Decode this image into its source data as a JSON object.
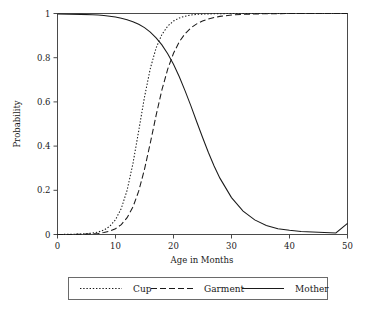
{
  "chart_data": {
    "type": "line",
    "title": "",
    "xlabel": "Age in Months",
    "ylabel": "Probability",
    "xlim": [
      0,
      50
    ],
    "ylim": [
      0,
      1
    ],
    "grid": false,
    "legend_position": "bottom",
    "xticks": [
      "0",
      "10",
      "20",
      "30",
      "40",
      "50"
    ],
    "xtick_values": [
      0,
      10,
      20,
      30,
      40,
      50
    ],
    "yticks": [
      "0",
      "0.2",
      "0.4",
      "0.6",
      "0.8",
      "1"
    ],
    "ytick_values": [
      0,
      0.2,
      0.4,
      0.6,
      0.8,
      1
    ],
    "x": [
      0,
      2,
      4,
      6,
      7,
      8,
      9,
      10,
      11,
      12,
      13,
      14,
      15,
      16,
      17,
      18,
      19,
      20,
      21,
      22,
      23,
      24,
      25,
      26,
      27,
      28,
      30,
      32,
      34,
      36,
      38,
      40,
      42,
      44,
      46,
      48,
      50
    ],
    "series": [
      {
        "name": "Cup",
        "style": "dotted",
        "color": "#1a1a1a",
        "values": [
          0.0,
          0.001,
          0.002,
          0.006,
          0.011,
          0.02,
          0.037,
          0.067,
          0.118,
          0.2,
          0.32,
          0.469,
          0.622,
          0.751,
          0.844,
          0.905,
          0.943,
          0.966,
          0.98,
          0.988,
          0.993,
          0.996,
          0.997,
          0.998,
          0.999,
          0.999,
          1.0,
          1.0,
          1.0,
          1.0,
          1.0,
          1.0,
          1.0,
          1.0,
          1.0,
          1.0,
          1.0
        ]
      },
      {
        "name": "Garment",
        "style": "dashed",
        "color": "#1a1a1a",
        "values": [
          0.0,
          0.0,
          0.001,
          0.003,
          0.005,
          0.009,
          0.015,
          0.026,
          0.045,
          0.076,
          0.124,
          0.196,
          0.295,
          0.414,
          0.539,
          0.654,
          0.748,
          0.82,
          0.872,
          0.909,
          0.935,
          0.953,
          0.966,
          0.975,
          0.982,
          0.987,
          0.993,
          0.996,
          0.998,
          0.999,
          0.999,
          1.0,
          1.0,
          1.0,
          1.0,
          1.0,
          1.0
        ]
      },
      {
        "name": "Mother",
        "style": "solid",
        "color": "#1a1a1a",
        "values": [
          0.998,
          0.997,
          0.996,
          0.994,
          0.993,
          0.991,
          0.988,
          0.984,
          0.979,
          0.972,
          0.963,
          0.951,
          0.936,
          0.916,
          0.89,
          0.858,
          0.818,
          0.77,
          0.714,
          0.65,
          0.582,
          0.51,
          0.44,
          0.372,
          0.31,
          0.255,
          0.167,
          0.106,
          0.066,
          0.041,
          0.026,
          0.019,
          0.014,
          0.011,
          0.009,
          0.007,
          0.05
        ]
      }
    ],
    "legend": [
      {
        "label": "Cup",
        "style": "dotted"
      },
      {
        "label": "Garment",
        "style": "dashed"
      },
      {
        "label": "Mother",
        "style": "solid"
      }
    ]
  }
}
